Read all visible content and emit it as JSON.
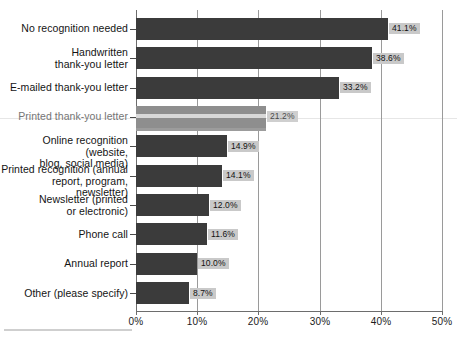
{
  "chart_data": {
    "type": "bar",
    "orientation": "horizontal",
    "title": "",
    "xlabel": "",
    "ylabel": "",
    "xlim": [
      0,
      50
    ],
    "xtick_labels": [
      "0%",
      "10%",
      "20%",
      "30%",
      "40%",
      "50%"
    ],
    "xtick_values": [
      0,
      10,
      20,
      30,
      40,
      50
    ],
    "grid": true,
    "legend": false,
    "bar_color": "#3b3b3b",
    "label_box_color": "#c9c9c9",
    "categories": [
      "No recognition needed",
      "Handwritten\nthank-you letter",
      "E-mailed thank-you letter",
      "Printed thank-you letter",
      "Online recognition (website,\nblog, social media)",
      "Printed recognition (annual\nreport, program, newsletter)",
      "Newsletter (printed\nor electronic)",
      "Phone call",
      "Annual report",
      "Other (please specify)"
    ],
    "values": [
      41.1,
      38.6,
      33.2,
      21.2,
      14.9,
      14.1,
      12.0,
      11.6,
      10.0,
      8.7
    ],
    "data_labels": [
      "41.1%",
      "38.6%",
      "33.2%",
      "21.2%",
      "14.9%",
      "14.1%",
      "12.0%",
      "11.6%",
      "10.0%",
      "8.7%"
    ]
  }
}
